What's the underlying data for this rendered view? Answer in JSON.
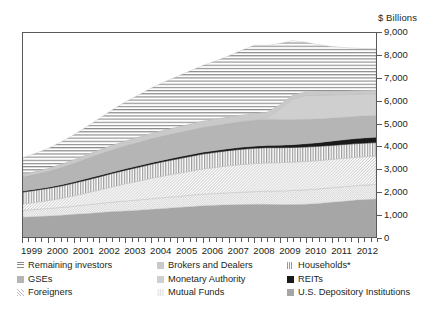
{
  "units_label": "$ Billions",
  "axes": {
    "y_ticks": [
      0,
      1000,
      2000,
      3000,
      4000,
      5000,
      6000,
      7000,
      8000,
      9000
    ],
    "y_tick_labels": [
      "0",
      "1,000",
      "2,000",
      "3,000",
      "4,000",
      "5,000",
      "6,000",
      "7,000",
      "8,000",
      "9,000"
    ],
    "y_min": 0,
    "y_max": 9000,
    "x_tick_labels": [
      "1999",
      "2000",
      "2001",
      "2002",
      "2003",
      "2004",
      "2005",
      "2006",
      "2007",
      "2008",
      "2009",
      "2010",
      "2011",
      "2012"
    ],
    "x_min": 1999,
    "x_max": 2012.75,
    "x_minor_ticks_per_year": 4
  },
  "legend": {
    "items": [
      {
        "label": "Remaining investors",
        "pattern": "horizontal-lines",
        "color": "#8a8a8a"
      },
      {
        "label": "Brokers and Dealers",
        "pattern": "light-solid",
        "color": "#c9c9c9"
      },
      {
        "label": "Households*",
        "pattern": "vertical-lines",
        "color": "#9a9a9a"
      },
      {
        "label": "GSEs",
        "pattern": "medium-solid",
        "color": "#b5b5b5"
      },
      {
        "label": "Monetary Authority",
        "pattern": "light-gray-solid",
        "color": "#cfcfcf"
      },
      {
        "label": "REITs",
        "pattern": "solid-black",
        "color": "#1a1a1a"
      },
      {
        "label": "Foreigners",
        "pattern": "diagonal-hatch",
        "color": "#d8d8d8"
      },
      {
        "label": "Mutual Funds",
        "pattern": "fine-dots",
        "color": "#e2e2e2"
      },
      {
        "label": "U.S. Depository Institutions",
        "pattern": "solid-gray",
        "color": "#a6a6a6"
      }
    ]
  },
  "chart_data": {
    "type": "area",
    "title": "",
    "xlabel": "",
    "ylabel": "$ Billions",
    "ylim": [
      0,
      9000
    ],
    "grid": false,
    "legend_position": "bottom",
    "stacked": true,
    "x": [
      1999,
      1999.5,
      2000,
      2000.5,
      2001,
      2001.5,
      2002,
      2002.5,
      2003,
      2003.5,
      2004,
      2004.5,
      2005,
      2005.5,
      2006,
      2006.5,
      2007,
      2007.5,
      2008,
      2008.5,
      2009,
      2009.5,
      2010,
      2010.5,
      2011,
      2011.5,
      2012,
      2012.75
    ],
    "series": [
      {
        "name": "U.S. Depository Institutions",
        "pattern": "solid-gray",
        "color": "#a6a6a6",
        "values": [
          870,
          900,
          930,
          960,
          1000,
          1040,
          1080,
          1120,
          1150,
          1180,
          1220,
          1260,
          1300,
          1340,
          1380,
          1400,
          1420,
          1430,
          1440,
          1440,
          1430,
          1430,
          1450,
          1480,
          1530,
          1580,
          1630,
          1680
        ]
      },
      {
        "name": "Mutual Funds",
        "pattern": "fine-dots",
        "color": "#e2e2e2",
        "values": [
          310,
          320,
          330,
          345,
          360,
          380,
          400,
          420,
          440,
          455,
          470,
          480,
          490,
          500,
          510,
          520,
          530,
          545,
          560,
          580,
          600,
          620,
          630,
          640,
          640,
          640,
          640,
          640
        ]
      },
      {
        "name": "Foreigners",
        "pattern": "diagonal-hatch",
        "color": "#d8d8d8",
        "values": [
          280,
          310,
          350,
          400,
          460,
          530,
          600,
          680,
          760,
          830,
          900,
          960,
          1010,
          1060,
          1110,
          1150,
          1190,
          1220,
          1240,
          1250,
          1250,
          1250,
          1250,
          1250,
          1250,
          1250,
          1250,
          1250
        ]
      },
      {
        "name": "Households*",
        "pattern": "vertical-lines",
        "color": "#9a9a9a",
        "values": [
          520,
          530,
          540,
          550,
          560,
          570,
          580,
          590,
          600,
          610,
          620,
          630,
          640,
          650,
          660,
          665,
          670,
          672,
          675,
          670,
          660,
          650,
          640,
          630,
          620,
          610,
          600,
          595
        ]
      },
      {
        "name": "REITs",
        "pattern": "solid-black",
        "color": "#1a1a1a",
        "values": [
          45,
          48,
          50,
          52,
          55,
          58,
          60,
          62,
          65,
          68,
          70,
          72,
          75,
          78,
          80,
          82,
          85,
          88,
          90,
          95,
          105,
          120,
          140,
          160,
          185,
          205,
          225,
          240
        ]
      },
      {
        "name": "GSEs",
        "pattern": "medium-solid",
        "color": "#b5b5b5",
        "values": [
          620,
          660,
          700,
          760,
          820,
          880,
          940,
          980,
          1010,
          1030,
          1050,
          1060,
          1070,
          1080,
          1090,
          1100,
          1110,
          1130,
          1150,
          1160,
          1140,
          1110,
          1080,
          1050,
          1020,
          1000,
          980,
          960
        ]
      },
      {
        "name": "Monetary Authority",
        "pattern": "light-gray-solid",
        "color": "#cfcfcf",
        "values": [
          0,
          0,
          0,
          0,
          0,
          0,
          0,
          0,
          0,
          0,
          0,
          0,
          0,
          0,
          0,
          0,
          0,
          0,
          0,
          60,
          450,
          900,
          1050,
          1050,
          1020,
          1000,
          980,
          960
        ]
      },
      {
        "name": "Brokers and Dealers",
        "pattern": "light-solid",
        "color": "#c9c9c9",
        "values": [
          120,
          130,
          140,
          150,
          165,
          180,
          195,
          210,
          225,
          235,
          245,
          255,
          265,
          275,
          285,
          290,
          295,
          300,
          300,
          250,
          200,
          180,
          170,
          165,
          160,
          155,
          150,
          150
        ]
      },
      {
        "name": "Remaining investors",
        "pattern": "horizontal-lines",
        "color": "#8a8a8a",
        "values": [
          735,
          800,
          880,
          980,
          1100,
          1240,
          1400,
          1560,
          1720,
          1860,
          2000,
          2120,
          2230,
          2340,
          2450,
          2560,
          2680,
          2840,
          3000,
          2950,
          2700,
          2400,
          2180,
          2060,
          1980,
          1920,
          1870,
          1830
        ]
      }
    ],
    "totals": [
      3500,
      3698,
      3920,
      4197,
      4520,
      4878,
      5255,
      5622,
      5970,
      6268,
      6575,
      6837,
      7080,
      7323,
      7565,
      7767,
      7980,
      8225,
      8455,
      8455,
      8535,
      8660,
      8590,
      8485,
      8405,
      8360,
      8325,
      8305
    ]
  }
}
